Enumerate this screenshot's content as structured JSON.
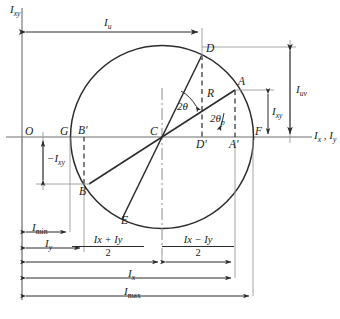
{
  "figure": {
    "type": "mohr-circle-moment-of-inertia",
    "axes": {
      "vertical_label": "Ixy",
      "vertical_label_main": "I",
      "vertical_label_sub": "xy",
      "horizontal_label_main_1": "I",
      "horizontal_label_sub_1": "x",
      "horizontal_label_sep": " , ",
      "horizontal_label_main_2": "I",
      "horizontal_label_sub_2": "y",
      "horizontal_label": "Ix , Iy",
      "origin_label": "O"
    },
    "points": [
      {
        "name": "O",
        "label": "O",
        "x": 22,
        "y": 137
      },
      {
        "name": "G",
        "label": "G",
        "x": 70,
        "y": 137
      },
      {
        "name": "Bp",
        "label": "B'",
        "x": 84,
        "y": 137
      },
      {
        "name": "C",
        "label": "C",
        "x": 162,
        "y": 137
      },
      {
        "name": "Dp",
        "label": "D'",
        "x": 202,
        "y": 137
      },
      {
        "name": "Ap",
        "label": "A'",
        "x": 235,
        "y": 137
      },
      {
        "name": "F",
        "label": "F",
        "x": 253,
        "y": 137
      },
      {
        "name": "D",
        "label": "D",
        "x": 202,
        "y": 55
      },
      {
        "name": "A",
        "label": "A",
        "x": 235,
        "y": 90
      },
      {
        "name": "B",
        "label": "B",
        "x": 84,
        "y": 184
      },
      {
        "name": "E",
        "label": "E",
        "x": 127,
        "y": 213
      }
    ],
    "circle": {
      "cx": 162,
      "cy": 137,
      "r": 91.5,
      "radius_label": "R"
    },
    "angles": [
      {
        "name": "two-theta",
        "label": "2θ"
      },
      {
        "name": "two-theta-p",
        "label": "2θp",
        "main": "2θ",
        "sub": "p"
      }
    ],
    "dimensions": {
      "Iu": {
        "label": "Iu",
        "main": "I",
        "sub": "u"
      },
      "Iuv": {
        "label": "Iuv",
        "main": "I",
        "sub": "uv"
      },
      "Ixy": {
        "label": "Ixy",
        "main": "I",
        "sub": "xy"
      },
      "negIxy": {
        "label": "-Ixy",
        "main": "−I",
        "sub": "xy"
      },
      "Imin": {
        "label": "Imin",
        "main": "I",
        "sub": "min"
      },
      "Imax": {
        "label": "Imax",
        "main": "I",
        "sub": "max"
      },
      "Iy": {
        "label": "Iy",
        "main": "I",
        "sub": "y"
      },
      "Ix": {
        "label": "Ix",
        "main": "I",
        "sub": "x"
      },
      "sum_over_two": {
        "numerator": "Ix + Iy",
        "denominator": "2"
      },
      "diff_over_two": {
        "numerator": "Ix − Iy",
        "denominator": "2"
      }
    },
    "colors": {
      "stroke": "#2b2b2b",
      "thin": "#6e6e6e",
      "text": "#1a1a1a",
      "background": "#ffffff"
    }
  }
}
